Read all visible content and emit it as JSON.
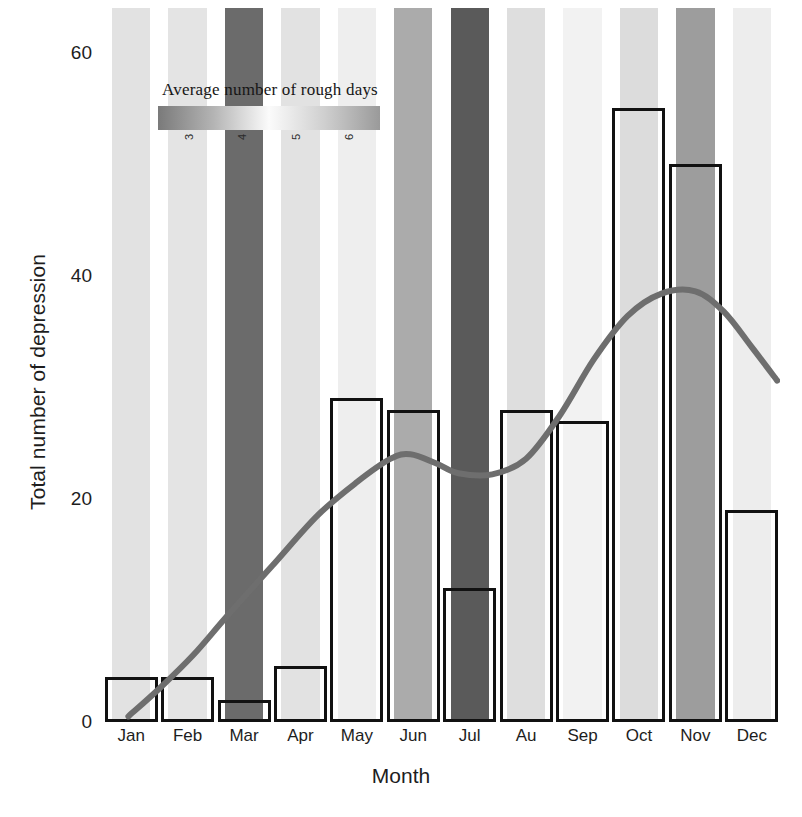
{
  "chart_data": {
    "type": "bar",
    "title": "",
    "xlabel": "Month",
    "ylabel": "Total number of depression",
    "categories": [
      "Jan",
      "Feb",
      "Mar",
      "Apr",
      "May",
      "Jun",
      "Jul",
      "Au",
      "Sep",
      "Oct",
      "Nov",
      "Dec"
    ],
    "values": [
      4,
      4,
      2,
      5,
      29,
      28,
      12,
      28,
      27,
      55,
      50,
      19
    ],
    "ylim": [
      0,
      64
    ],
    "yticks": [
      0,
      20,
      40,
      60
    ],
    "ytick_labels": [
      "0",
      "20",
      "40",
      "60"
    ],
    "grid": false,
    "legend_position": "inside-upper-left",
    "bar_style": {
      "fill": "none",
      "edge_color": "#111111",
      "edge_width": 3
    },
    "series": [
      {
        "name": "Total number of depression",
        "type": "bar",
        "values": [
          4,
          4,
          2,
          5,
          29,
          28,
          12,
          28,
          27,
          55,
          50,
          19
        ]
      },
      {
        "name": "Average number of rough days",
        "type": "background-band-heatmap",
        "values": [
          3.4,
          3.3,
          5.9,
          3.5,
          3.1,
          5.0,
          6.1,
          3.6,
          2.9,
          3.4,
          5.2,
          3.1
        ],
        "colors": [
          "#e2e2e2",
          "#e4e4e4",
          "#6b6b6b",
          "#e2e2e2",
          "#eeeeee",
          "#ababab",
          "#5a5a5a",
          "#dedede",
          "#f2f2f2",
          "#dcdcdc",
          "#9d9d9d",
          "#ededed"
        ]
      },
      {
        "name": "trend",
        "type": "line",
        "color": "#6e6e6e",
        "width": 6,
        "points": [
          [
            0.45,
            0.5
          ],
          [
            1.0,
            3.0
          ],
          [
            1.6,
            6.0
          ],
          [
            2.2,
            9.5
          ],
          [
            3.0,
            14.0
          ],
          [
            3.8,
            18.5
          ],
          [
            4.5,
            21.5
          ],
          [
            5.1,
            23.6
          ],
          [
            5.45,
            24.0
          ],
          [
            5.9,
            23.2
          ],
          [
            6.3,
            22.3
          ],
          [
            6.9,
            22.2
          ],
          [
            7.5,
            23.6
          ],
          [
            8.1,
            27.5
          ],
          [
            8.7,
            32.5
          ],
          [
            9.3,
            36.4
          ],
          [
            9.9,
            38.4
          ],
          [
            10.5,
            38.6
          ],
          [
            11.0,
            36.8
          ],
          [
            11.5,
            33.6
          ],
          [
            11.95,
            30.6
          ]
        ]
      }
    ],
    "legend": {
      "title": "Average number of rough days",
      "ticks": [
        "3",
        "4",
        "5",
        "6"
      ],
      "tick_positions": [
        0.14,
        0.38,
        0.62,
        0.86
      ],
      "gradient_stops": [
        "#7a7a7a",
        "#b4b4b4",
        "#fbfbfb",
        "#cfcfcf",
        "#9a9a9a"
      ]
    }
  }
}
